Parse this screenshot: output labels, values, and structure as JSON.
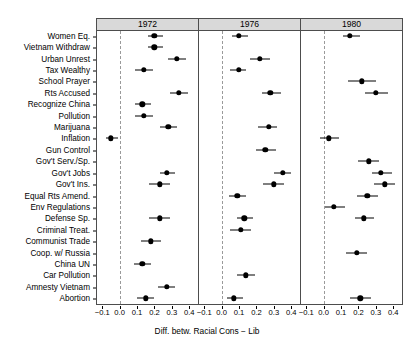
{
  "chart_data": {
    "type": "scatter",
    "title": "",
    "xlabel": "Diff. betw. Racial Cons − Lib",
    "ylabel": "",
    "xlim": [
      -0.13,
      0.45
    ],
    "xticks": [
      -0.1,
      0.0,
      0.1,
      0.2,
      0.3,
      0.4
    ],
    "xticklabels": [
      "−0.1",
      "0.0",
      "0.1",
      "0.2",
      "0.3",
      "0.4"
    ],
    "grid": false,
    "legend": null,
    "reference_line": 0.0,
    "panels": [
      "1972",
      "1976",
      "1980"
    ],
    "categories": [
      "Women Eq.",
      "Vietnam Withdraw",
      "Urban Unrest",
      "Tax Wealthy",
      "School Prayer",
      "Rts Accused",
      "Recognize China",
      "Pollution",
      "Marijuana",
      "Inflation",
      "Gun Control",
      "Gov't Serv./Sp.",
      "Gov't Jobs",
      "Gov't Ins.",
      "Equal Rts Amend.",
      "Env Regulations",
      "Defense Sp.",
      "Criminal Treat.",
      "Communist Trade",
      "Coop. w/ Russia",
      "China UN",
      "Car Pollution",
      "Amnesty Vietnam",
      "Abortion"
    ],
    "series": [
      {
        "name": "1972",
        "points": [
          {
            "category": "Women Eq.",
            "estimate": 0.2,
            "low": 0.16,
            "high": 0.25
          },
          {
            "category": "Vietnam Withdraw",
            "estimate": 0.2,
            "low": 0.16,
            "high": 0.25
          },
          {
            "category": "Urban Unrest",
            "estimate": 0.33,
            "low": 0.28,
            "high": 0.38
          },
          {
            "category": "Tax Wealthy",
            "estimate": 0.14,
            "low": 0.09,
            "high": 0.19
          },
          {
            "category": "School Prayer",
            "estimate": null,
            "low": null,
            "high": null
          },
          {
            "category": "Rts Accused",
            "estimate": 0.34,
            "low": 0.29,
            "high": 0.39
          },
          {
            "category": "Recognize China",
            "estimate": 0.13,
            "low": 0.09,
            "high": 0.18
          },
          {
            "category": "Pollution",
            "estimate": 0.14,
            "low": 0.09,
            "high": 0.19
          },
          {
            "category": "Marijuana",
            "estimate": 0.28,
            "low": 0.23,
            "high": 0.33
          },
          {
            "category": "Inflation",
            "estimate": -0.05,
            "low": -0.08,
            "high": -0.01
          },
          {
            "category": "Gun Control",
            "estimate": null,
            "low": null,
            "high": null
          },
          {
            "category": "Gov't Serv./Sp.",
            "estimate": null,
            "low": null,
            "high": null
          },
          {
            "category": "Gov't Jobs",
            "estimate": 0.27,
            "low": 0.23,
            "high": 0.32
          },
          {
            "category": "Gov't Ins.",
            "estimate": 0.23,
            "low": 0.17,
            "high": 0.29
          },
          {
            "category": "Equal Rts Amend.",
            "estimate": null,
            "low": null,
            "high": null
          },
          {
            "category": "Env Regulations",
            "estimate": null,
            "low": null,
            "high": null
          },
          {
            "category": "Defense Sp.",
            "estimate": 0.23,
            "low": 0.17,
            "high": 0.29
          },
          {
            "category": "Criminal Treat.",
            "estimate": null,
            "low": null,
            "high": null
          },
          {
            "category": "Communist Trade",
            "estimate": 0.18,
            "low": 0.12,
            "high": 0.24
          },
          {
            "category": "Coop. w/ Russia",
            "estimate": null,
            "low": null,
            "high": null
          },
          {
            "category": "China UN",
            "estimate": 0.13,
            "low": 0.08,
            "high": 0.18
          },
          {
            "category": "Car Pollution",
            "estimate": null,
            "low": null,
            "high": null
          },
          {
            "category": "Amnesty Vietnam",
            "estimate": 0.27,
            "low": 0.22,
            "high": 0.32
          },
          {
            "category": "Abortion",
            "estimate": 0.15,
            "low": 0.1,
            "high": 0.2
          }
        ]
      },
      {
        "name": "1976",
        "points": [
          {
            "category": "Women Eq.",
            "estimate": 0.1,
            "low": 0.06,
            "high": 0.15
          },
          {
            "category": "Vietnam Withdraw",
            "estimate": null,
            "low": null,
            "high": null
          },
          {
            "category": "Urban Unrest",
            "estimate": 0.22,
            "low": 0.16,
            "high": 0.28
          },
          {
            "category": "Tax Wealthy",
            "estimate": 0.1,
            "low": 0.05,
            "high": 0.14
          },
          {
            "category": "School Prayer",
            "estimate": null,
            "low": null,
            "high": null
          },
          {
            "category": "Rts Accused",
            "estimate": 0.28,
            "low": 0.23,
            "high": 0.34
          },
          {
            "category": "Recognize China",
            "estimate": null,
            "low": null,
            "high": null
          },
          {
            "category": "Pollution",
            "estimate": null,
            "low": null,
            "high": null
          },
          {
            "category": "Marijuana",
            "estimate": 0.27,
            "low": 0.21,
            "high": 0.32
          },
          {
            "category": "Inflation",
            "estimate": null,
            "low": null,
            "high": null
          },
          {
            "category": "Gun Control",
            "estimate": 0.25,
            "low": 0.2,
            "high": 0.31
          },
          {
            "category": "Gov't Serv./Sp.",
            "estimate": null,
            "low": null,
            "high": null
          },
          {
            "category": "Gov't Jobs",
            "estimate": 0.35,
            "low": 0.3,
            "high": 0.4
          },
          {
            "category": "Gov't Ins.",
            "estimate": 0.3,
            "low": 0.24,
            "high": 0.36
          },
          {
            "category": "Equal Rts Amend.",
            "estimate": 0.09,
            "low": 0.04,
            "high": 0.14
          },
          {
            "category": "Env Regulations",
            "estimate": null,
            "low": null,
            "high": null
          },
          {
            "category": "Defense Sp.",
            "estimate": 0.13,
            "low": 0.09,
            "high": 0.18
          },
          {
            "category": "Criminal Treat.",
            "estimate": 0.11,
            "low": 0.05,
            "high": 0.17
          },
          {
            "category": "Communist Trade",
            "estimate": null,
            "low": null,
            "high": null
          },
          {
            "category": "Coop. w/ Russia",
            "estimate": null,
            "low": null,
            "high": null
          },
          {
            "category": "China UN",
            "estimate": null,
            "low": null,
            "high": null
          },
          {
            "category": "Car Pollution",
            "estimate": 0.14,
            "low": 0.09,
            "high": 0.19
          },
          {
            "category": "Amnesty Vietnam",
            "estimate": null,
            "low": null,
            "high": null
          },
          {
            "category": "Abortion",
            "estimate": 0.07,
            "low": 0.03,
            "high": 0.12
          }
        ]
      },
      {
        "name": "1980",
        "points": [
          {
            "category": "Women Eq.",
            "estimate": 0.15,
            "low": 0.11,
            "high": 0.21
          },
          {
            "category": "Vietnam Withdraw",
            "estimate": null,
            "low": null,
            "high": null
          },
          {
            "category": "Urban Unrest",
            "estimate": null,
            "low": null,
            "high": null
          },
          {
            "category": "Tax Wealthy",
            "estimate": null,
            "low": null,
            "high": null
          },
          {
            "category": "School Prayer",
            "estimate": 0.22,
            "low": 0.14,
            "high": 0.3
          },
          {
            "category": "Rts Accused",
            "estimate": 0.3,
            "low": 0.24,
            "high": 0.37
          },
          {
            "category": "Recognize China",
            "estimate": null,
            "low": null,
            "high": null
          },
          {
            "category": "Pollution",
            "estimate": null,
            "low": null,
            "high": null
          },
          {
            "category": "Marijuana",
            "estimate": null,
            "low": null,
            "high": null
          },
          {
            "category": "Inflation",
            "estimate": 0.03,
            "low": -0.02,
            "high": 0.09
          },
          {
            "category": "Gun Control",
            "estimate": null,
            "low": null,
            "high": null
          },
          {
            "category": "Gov't Serv./Sp.",
            "estimate": 0.26,
            "low": 0.2,
            "high": 0.32
          },
          {
            "category": "Gov't Jobs",
            "estimate": 0.33,
            "low": 0.28,
            "high": 0.39
          },
          {
            "category": "Gov't Ins.",
            "estimate": 0.35,
            "low": 0.29,
            "high": 0.41
          },
          {
            "category": "Equal Rts Amend.",
            "estimate": 0.25,
            "low": 0.19,
            "high": 0.31
          },
          {
            "category": "Env Regulations",
            "estimate": 0.06,
            "low": 0.01,
            "high": 0.12
          },
          {
            "category": "Defense Sp.",
            "estimate": 0.23,
            "low": 0.18,
            "high": 0.29
          },
          {
            "category": "Criminal Treat.",
            "estimate": null,
            "low": null,
            "high": null
          },
          {
            "category": "Communist Trade",
            "estimate": null,
            "low": null,
            "high": null
          },
          {
            "category": "Coop. w/ Russia",
            "estimate": 0.19,
            "low": 0.13,
            "high": 0.25
          },
          {
            "category": "China UN",
            "estimate": null,
            "low": null,
            "high": null
          },
          {
            "category": "Car Pollution",
            "estimate": null,
            "low": null,
            "high": null
          },
          {
            "category": "Amnesty Vietnam",
            "estimate": null,
            "low": null,
            "high": null
          },
          {
            "category": "Abortion",
            "estimate": 0.21,
            "low": 0.15,
            "high": 0.27
          }
        ]
      }
    ]
  }
}
